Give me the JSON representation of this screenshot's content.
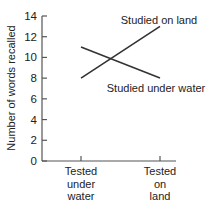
{
  "chart_data": {
    "type": "line",
    "title": "",
    "xlabel": "",
    "ylabel": "Number of words recalled",
    "ylim": [
      0,
      14
    ],
    "yticks": [
      0,
      2,
      4,
      6,
      8,
      10,
      12,
      14
    ],
    "grid": false,
    "legend_position": "inline labels at line ends",
    "categories": [
      "Tested under water",
      "Tested on land"
    ],
    "category_label_lines": [
      [
        "Tested",
        "under",
        "water"
      ],
      [
        "Tested",
        "on",
        "land"
      ]
    ],
    "series": [
      {
        "name": "Studied on land",
        "values": [
          8,
          13
        ]
      },
      {
        "name": "Studied under water",
        "values": [
          11,
          8
        ]
      }
    ]
  },
  "colors": {
    "line": "#333333",
    "axis": "#555555",
    "text": "#222222",
    "background": "#ffffff"
  }
}
